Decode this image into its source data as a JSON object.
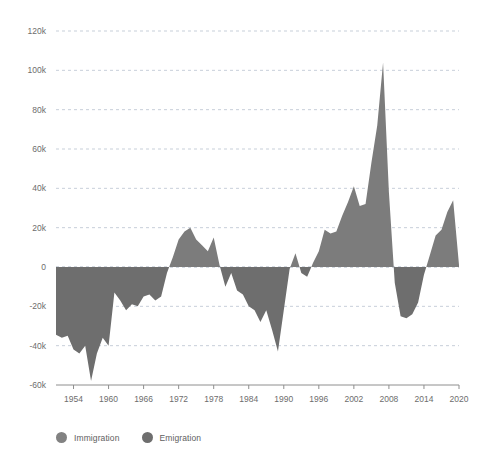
{
  "chart_data": {
    "type": "area",
    "title": "",
    "subtitle": "",
    "xlabel": "",
    "ylabel": "",
    "xlim": [
      1951,
      2020
    ],
    "ylim": [
      -60000,
      120000
    ],
    "grid": true,
    "legend_position": "bottom-left",
    "y_ticks": [
      120000,
      100000,
      80000,
      60000,
      40000,
      20000,
      0,
      -20000,
      -40000,
      -60000
    ],
    "y_tick_labels": [
      "120k",
      "100k",
      "80k",
      "60k",
      "40k",
      "20k",
      "0",
      "-20k",
      "-40k",
      "-60k"
    ],
    "x_ticks": [
      1954,
      1960,
      1966,
      1972,
      1978,
      1984,
      1990,
      1996,
      2002,
      2008,
      2014,
      2020
    ],
    "x_tick_labels": [
      "1954",
      "1960",
      "1966",
      "1972",
      "1978",
      "1984",
      "1990",
      "1996",
      "2002",
      "2008",
      "2014",
      "2020"
    ],
    "series": [
      {
        "name": "Net migration",
        "positive_label": "Immigration",
        "negative_label": "Emigration",
        "x": [
          1951,
          1952,
          1953,
          1954,
          1955,
          1956,
          1957,
          1958,
          1959,
          1960,
          1961,
          1962,
          1963,
          1964,
          1965,
          1966,
          1967,
          1968,
          1969,
          1970,
          1971,
          1972,
          1973,
          1974,
          1975,
          1976,
          1977,
          1978,
          1979,
          1980,
          1981,
          1982,
          1983,
          1984,
          1985,
          1986,
          1987,
          1988,
          1989,
          1990,
          1991,
          1992,
          1993,
          1994,
          1995,
          1996,
          1997,
          1998,
          1999,
          2000,
          2001,
          2002,
          2003,
          2004,
          2005,
          2006,
          2007,
          2008,
          2009,
          2010,
          2011,
          2012,
          2013,
          2014,
          2015,
          2016,
          2017,
          2018,
          2019,
          2020
        ],
        "values": [
          -34500,
          -36000,
          -35000,
          -42000,
          -44000,
          -40000,
          -58000,
          -44000,
          -36000,
          -40000,
          -13000,
          -17000,
          -22000,
          -19000,
          -20000,
          -15000,
          -14000,
          -17000,
          -15000,
          -3000,
          5000,
          14000,
          18000,
          20000,
          14000,
          11000,
          8000,
          15000,
          1000,
          -10000,
          -3000,
          -12000,
          -14000,
          -20000,
          -22000,
          -28000,
          -22000,
          -32000,
          -43000,
          -22000,
          -1000,
          7000,
          -3000,
          -5000,
          2000,
          8000,
          19000,
          17000,
          18000,
          26000,
          33000,
          41000,
          31000,
          32000,
          53000,
          72000,
          104000,
          38000,
          -8000,
          -25000,
          -26000,
          -24000,
          -18000,
          -4000,
          6000,
          16000,
          19000,
          28000,
          34000,
          1000
        ]
      }
    ],
    "colors": {
      "immigration": "#7c7c7c",
      "emigration": "#6e6e6e",
      "gridline": "#b9c3cf",
      "axis": "#8e8e8e",
      "text": "#6d6d6d",
      "background": "#ffffff"
    }
  },
  "legend": {
    "items": [
      {
        "label": "Immigration",
        "color": "#828282"
      },
      {
        "label": "Emigration",
        "color": "#6e6e6e"
      }
    ]
  }
}
